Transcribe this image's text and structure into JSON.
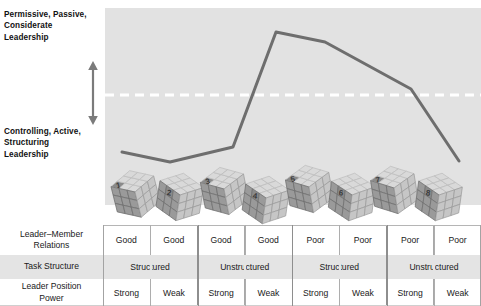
{
  "diagram": {
    "title_hidden": "",
    "axis": {
      "top_label": "Permissive, Passive,\nConsiderate\nLeadership",
      "top_label_lines": [
        "Permissive, Passive,",
        "Considerate",
        "Leadership"
      ],
      "bottom_label_lines": [
        "Controlling, Active,",
        "Structuring",
        "Leadership"
      ],
      "arrow_name": "double-headed-vertical-arrow"
    },
    "panel_color": "#e2e2e2",
    "line_color": "#6e6e6e",
    "dashed_line_color": "#ffffff",
    "cube_numbers": [
      "1",
      "2",
      "3",
      "4",
      "5",
      "6",
      "7",
      "8"
    ]
  },
  "chart_data": {
    "type": "line",
    "xlabel": "",
    "ylabel": "Leadership Style",
    "legend_position": "none",
    "grid": false,
    "ylim": [
      0,
      1
    ],
    "categories": [
      "1",
      "2",
      "3",
      "4",
      "5",
      "6",
      "7",
      "8"
    ],
    "midline_y": 95,
    "series": [
      {
        "name": "Preferred leadership style",
        "points": [
          {
            "x": 122,
            "y": 152
          },
          {
            "x": 170,
            "y": 162
          },
          {
            "x": 233,
            "y": 147
          },
          {
            "x": 276,
            "y": 32
          },
          {
            "x": 325,
            "y": 42
          },
          {
            "x": 411,
            "y": 89
          },
          {
            "x": 459,
            "y": 161
          }
        ]
      }
    ]
  },
  "table": {
    "rows": [
      {
        "label_lines": [
          "Leader–Member",
          "Relations"
        ],
        "label": "Leader–Member Relations",
        "cells": [
          "Good",
          "Good",
          "Good",
          "Good",
          "Poor",
          "Poor",
          "Poor",
          "Poor"
        ],
        "spans": [
          1,
          1,
          1,
          1,
          1,
          1,
          1,
          1
        ]
      },
      {
        "label_lines": [
          "Task Structure"
        ],
        "label": "Task Structure",
        "cells": [
          "Structured",
          "Unstructured",
          "Structured",
          "Unstructured"
        ],
        "spans": [
          2,
          2,
          2,
          2
        ]
      },
      {
        "label_lines": [
          "Leader Position",
          "Power"
        ],
        "label": "Leader Position Power",
        "cells": [
          "Strong",
          "Weak",
          "Strong",
          "Weak",
          "Strong",
          "Weak",
          "Strong",
          "Weak"
        ],
        "spans": [
          1,
          1,
          1,
          1,
          1,
          1,
          1,
          1
        ]
      }
    ]
  }
}
